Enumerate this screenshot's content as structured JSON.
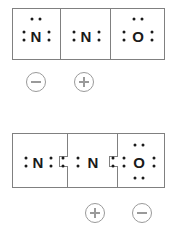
{
  "diagram": {
    "stroke_color": "#808080",
    "atom_color": "#1a1a1a",
    "charge_color": "#9a9a9a",
    "background": "#ffffff",
    "structures": [
      {
        "id": "structure-1",
        "name": "resonance-structure-1",
        "cells": [
          {
            "atom": "N",
            "name": "nitrogen-left",
            "lone_pairs": [
              "top",
              "left",
              "right"
            ]
          },
          {
            "atom": "N",
            "name": "nitrogen-center",
            "lone_pairs": [
              "left",
              "right"
            ]
          },
          {
            "atom": "O",
            "name": "oxygen-right",
            "lone_pairs": [
              "top",
              "left",
              "right"
            ]
          }
        ],
        "charges": [
          {
            "name": "formal-charge-negative",
            "symbol": "minus",
            "under_cell": 0
          },
          {
            "name": "formal-charge-positive",
            "symbol": "plus",
            "under_cell": 1
          }
        ]
      },
      {
        "id": "structure-2",
        "name": "resonance-structure-2",
        "cells": [
          {
            "atom": "N",
            "name": "nitrogen-left",
            "lone_pairs": [
              "left",
              "right"
            ]
          },
          {
            "atom": "N",
            "name": "nitrogen-center",
            "lone_pairs": [
              "left",
              "right"
            ]
          },
          {
            "atom": "O",
            "name": "oxygen-right",
            "lone_pairs": [
              "top",
              "bottom",
              "left",
              "right"
            ]
          }
        ],
        "charges": [
          {
            "name": "formal-charge-positive",
            "symbol": "plus",
            "under_cell": 1
          },
          {
            "name": "formal-charge-negative",
            "symbol": "minus",
            "under_cell": 2
          }
        ]
      }
    ],
    "atoms": {
      "s1_c1": "N",
      "s1_c2": "N",
      "s1_c3": "O",
      "s2_c1": "N",
      "s2_c2": "N",
      "s2_c3": "O"
    }
  }
}
